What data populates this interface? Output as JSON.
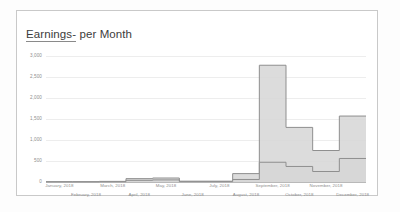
{
  "card": {
    "title_underlined": "Earnings-",
    "title_rest": " per Month"
  },
  "colors": {
    "area_fill": "#d6d6d6",
    "area_stroke": "#8f8f8f",
    "gridline": "#ededed",
    "axis_line": "#b9b9b9",
    "tick_text": "#8e8e8e",
    "title_text": "#3c3c3c",
    "card_border": "#c9c9c9",
    "page_background": "#fdfdfd"
  },
  "chart_data": {
    "type": "area",
    "title": "Earnings- per Month",
    "xlabel": "",
    "ylabel": "",
    "ylim": [
      0,
      3000
    ],
    "yticks": [
      0,
      500,
      1000,
      1500,
      2000,
      2500,
      3000
    ],
    "ytick_labels": [
      "0",
      "500",
      "1,000",
      "1,500",
      "2,000",
      "2,500",
      "3,000"
    ],
    "grid": true,
    "legend": "none",
    "step_style": "step-post",
    "categories": [
      "January, 2018",
      "February, 2018",
      "March, 2018",
      "April, 2018",
      "May, 2018",
      "June, 2018",
      "July, 2018",
      "August, 2018",
      "September, 2018",
      "October, 2018",
      "November, 2018",
      "December, 2018"
    ],
    "series": [
      {
        "name": "Upper area",
        "values": [
          10,
          10,
          15,
          80,
          95,
          20,
          20,
          200,
          2780,
          1300,
          750,
          1570
        ]
      },
      {
        "name": "Lower area",
        "values": [
          5,
          5,
          8,
          40,
          50,
          10,
          10,
          60,
          470,
          370,
          250,
          560
        ]
      }
    ]
  }
}
